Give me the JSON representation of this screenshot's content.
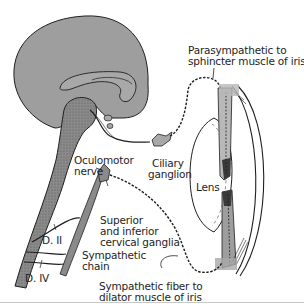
{
  "diagram": {
    "colors": {
      "brain_fill": "#9e9e9e",
      "brainstem_fill": "#7a7a7a",
      "muscle_fill": "#a8a8a8",
      "line": "#1e1e1e",
      "background": "#ffffff"
    },
    "labels": {
      "parasympathetic_line1": "Parasympathetic to",
      "parasympathetic_line2": "sphincter muscle of iris",
      "oculomotor_line1": "Oculomotor",
      "oculomotor_line2": "nerve",
      "ciliary_line1": "Ciliary",
      "ciliary_line2": "ganglion",
      "lens": "Lens",
      "superior_line1": "Superior",
      "superior_line2": "and inferior",
      "superior_line3": "cervical ganglia",
      "d2": "D. II",
      "sympathetic_chain_line1": "Sympathetic",
      "sympathetic_chain_line2": "chain",
      "d4": "D. IV",
      "sympathetic_fiber_line1": "Sympathetic fiber to",
      "sympathetic_fiber_line2": "dilator muscle of iris"
    }
  }
}
